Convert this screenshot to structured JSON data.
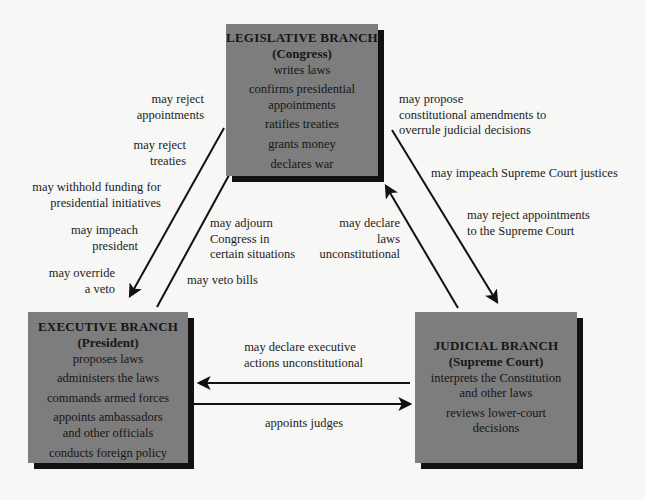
{
  "colors": {
    "box_fill": "#7d7d7d",
    "box_shadow": "#111111",
    "background": "#f7f7f5",
    "arrow": "#111111"
  },
  "legislative": {
    "title": "LEGISLATIVE BRANCH",
    "subtitle": "(Congress)",
    "powers": [
      "writes laws",
      "confirms presidential",
      "appointments",
      "ratifies treaties",
      "grants money",
      "declares war"
    ]
  },
  "executive": {
    "title": "EXECUTIVE BRANCH",
    "subtitle": "(President)",
    "powers": [
      "proposes laws",
      "administers the laws",
      "commands armed forces",
      "appoints ambassadors",
      "and other officials",
      "conducts foreign policy"
    ]
  },
  "judicial": {
    "title": "JUDICIAL BRANCH",
    "subtitle": "(Supreme Court)",
    "powers": [
      "interprets the Constitution",
      "and other laws",
      "reviews lower-court",
      "decisions"
    ]
  },
  "checks": {
    "leg_on_exec": [
      [
        "may reject",
        "appointments"
      ],
      [
        "may reject",
        "treaties"
      ],
      [
        "may withhold funding for",
        "presidential initiatives"
      ],
      [
        "may impeach",
        "president"
      ],
      [
        "may override",
        "a veto"
      ]
    ],
    "exec_on_leg": [
      [
        "may adjourn",
        "Congress in",
        "certain situations"
      ],
      [
        "may veto bills"
      ]
    ],
    "jud_on_leg": [
      "may declare",
      "laws",
      "unconstitutional"
    ],
    "leg_on_jud": [
      [
        "may propose",
        "constitutional amendments to",
        "overrule judicial decisions"
      ],
      [
        "may impeach Supreme Court justices"
      ],
      [
        "may reject appointments",
        "to the Supreme Court"
      ]
    ],
    "jud_on_exec": [
      "may declare executive",
      "actions unconstitutional"
    ],
    "exec_on_jud": [
      "appoints judges"
    ]
  }
}
